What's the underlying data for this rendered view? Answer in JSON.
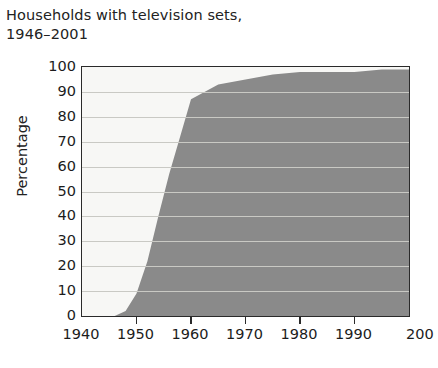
{
  "chart_data": {
    "type": "area",
    "title": "Households with television sets,\n1946–2001",
    "title_line1": "Households with television sets,",
    "title_line2": "1946–2001",
    "xlabel": "",
    "ylabel": "Percentage",
    "xlim": [
      1940,
      2000
    ],
    "ylim": [
      0,
      100
    ],
    "grid": true,
    "legend": "none",
    "x_tick_labels": [
      "1940",
      "1950",
      "1960",
      "1970",
      "1980",
      "1990",
      "200"
    ],
    "x_tick_values": [
      1940,
      1950,
      1960,
      1970,
      1980,
      1990,
      2000
    ],
    "x_last_label_clipped": true,
    "y_tick_labels": [
      "100",
      "90",
      "80",
      "70",
      "60",
      "50",
      "40",
      "30",
      "20",
      "10",
      "0"
    ],
    "y_tick_values": [
      100,
      90,
      80,
      70,
      60,
      50,
      40,
      30,
      20,
      10,
      0
    ],
    "series": [
      {
        "name": "Households with television sets",
        "x": [
          1940,
          1946,
          1948,
          1950,
          1952,
          1954,
          1956,
          1958,
          1960,
          1965,
          1970,
          1975,
          1980,
          1985,
          1990,
          1995,
          2000,
          2001
        ],
        "values": [
          0,
          0,
          2,
          9,
          22,
          40,
          57,
          72,
          87,
          93,
          95,
          97,
          98,
          98,
          98,
          99,
          99,
          99
        ]
      }
    ],
    "colors": {
      "area_fill": "#8a8a8a",
      "plot_background": "#f7f7f5",
      "gridline": "#c9c9c4",
      "axis": "#2a2a2a",
      "text": "#1c1c1c"
    }
  }
}
